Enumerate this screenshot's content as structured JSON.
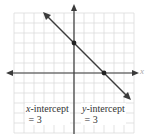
{
  "chart_data": {
    "type": "line",
    "title": "",
    "xlabel": "x",
    "ylabel": "y",
    "xlim": [
      -6,
      6
    ],
    "ylim": [
      -6,
      6
    ],
    "grid": true,
    "line": {
      "equation": "y = -x + 3",
      "slope": -1,
      "intercept": 3
    },
    "points": [
      {
        "x": 0,
        "y": 3,
        "label": "y-intercept point"
      },
      {
        "x": 3,
        "y": 0,
        "label": "x-intercept point"
      }
    ],
    "annotations": [
      {
        "text_var": "x",
        "text": "-intercept",
        "value": "= 3"
      },
      {
        "text_var": "y",
        "text": "-intercept",
        "value": "= 3"
      }
    ],
    "colors": {
      "line": "#3a3a3a",
      "axis": "#3a3a3a",
      "grid": "#dcdcdc",
      "point": "#222222"
    }
  },
  "labels": {
    "x_intercept": {
      "var": "x",
      "rest": "-intercept",
      "value": "= 3"
    },
    "y_intercept": {
      "var": "y",
      "rest": "-intercept",
      "value": "= 3"
    },
    "x_axis_name": "x"
  }
}
